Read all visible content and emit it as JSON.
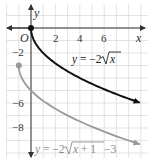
{
  "chart_data": {
    "type": "line",
    "title": "",
    "xlabel": "x",
    "ylabel": "y",
    "xlim": [
      -2.5,
      9.6
    ],
    "ylim": [
      -10.2,
      1.8
    ],
    "grid": true,
    "origin_label": "O",
    "x_ticks": [
      {
        "value": 2,
        "label": "2"
      },
      {
        "value": 4,
        "label": "4"
      },
      {
        "value": 6,
        "label": "6"
      }
    ],
    "y_ticks": [
      {
        "value": -2,
        "label": "−2"
      },
      {
        "value": -6,
        "label": "−6"
      },
      {
        "value": -8,
        "label": "−8"
      }
    ],
    "series": [
      {
        "name": "y = −2√x",
        "equation": "y = -2*sqrt(x)",
        "color": "#111111",
        "start_point": [
          0,
          0
        ],
        "end_x": 8.9,
        "x": [
          0,
          0.25,
          1,
          2,
          3,
          4,
          5,
          6,
          7,
          8,
          8.9
        ],
        "values": [
          0,
          -1,
          -2,
          -2.83,
          -3.46,
          -4,
          -4.47,
          -4.9,
          -5.29,
          -5.66,
          -5.97
        ]
      },
      {
        "name": "y = −2√(x + 1) − 3",
        "equation": "y = -2*sqrt(x+1) - 3",
        "color": "#999999",
        "start_point": [
          -1,
          -3
        ],
        "end_x": 8.9,
        "x": [
          -1,
          -0.75,
          0,
          1,
          2,
          3,
          4,
          5,
          6,
          7,
          8,
          8.9
        ],
        "values": [
          -3,
          -4,
          -5,
          -5.83,
          -6.46,
          -7,
          -7.47,
          -7.9,
          -8.29,
          -8.66,
          -9,
          -9.29
        ]
      }
    ],
    "annotations": [
      {
        "text": "y = −2√x",
        "near": [
          6,
          -2.5
        ]
      },
      {
        "text": "y = −2√(x + 1) − 3",
        "near": [
          4,
          -9.8
        ]
      }
    ]
  },
  "labels": {
    "origin": "O",
    "x_axis": "x",
    "y_axis": "y",
    "eq1_prefix": "y = −2",
    "eq1_radicand": "x",
    "eq2_prefix": "y = −2",
    "eq2_radicand": "x + 1",
    "eq2_suffix": " −3",
    "xt2": "2",
    "xt4": "4",
    "xt6": "6",
    "ytm2": "−2",
    "ytm6": "−6",
    "ytm8": "−8"
  }
}
